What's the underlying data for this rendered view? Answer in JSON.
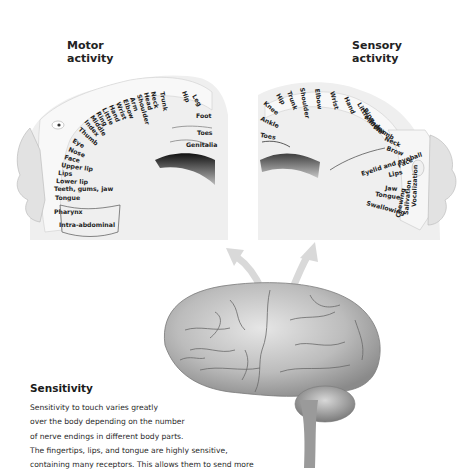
{
  "motor_panel": {
    "title_line1": "Motor",
    "title_line2": "activity",
    "labels": [
      "Trunk",
      "Neck",
      "Head",
      "Shoulder",
      "Arm",
      "Elbow",
      "Wrist",
      "Hand",
      "Little",
      "Ring",
      "Middle",
      "Index",
      "Thumb",
      "Eye",
      "Nose",
      "Face",
      "Upper lip",
      "Lips",
      "Lower lip",
      "Teeth, gums, jaw",
      "Tongue",
      "Pharynx",
      "Intra-abdominal",
      "Hip",
      "Leg",
      "Foot",
      "Toes",
      "Genitalia"
    ]
  },
  "sensory_panel": {
    "title_line1": "Sensory",
    "title_line2": "activity",
    "labels": [
      "Knee",
      "Hip",
      "Trunk",
      "Shoulder",
      "Elbow",
      "Wrist",
      "Hand",
      "Little",
      "Ring",
      "Middle",
      "Index",
      "Thumb",
      "Neck",
      "Brow",
      "Eyelid and eyeball",
      "Face",
      "Lips",
      "Jaw",
      "Tongue",
      "Swallowing",
      "Chewing",
      "Salivation",
      "Vocalization",
      "Ankle",
      "Toes"
    ]
  },
  "sensitivity": {
    "heading": "Sensitivity",
    "lines": [
      "Sensitivity to touch varies greatly",
      "over the body depending on the number",
      "of nerve endings in different body parts.",
      "The fingertips, lips, and tongue are highly sensitive,",
      "containing many receptors. This allows them to send more"
    ]
  },
  "colors": {
    "arrow": "#d9d9d9",
    "brain": "#bdbdbd",
    "strip": "#f4f4f4"
  }
}
